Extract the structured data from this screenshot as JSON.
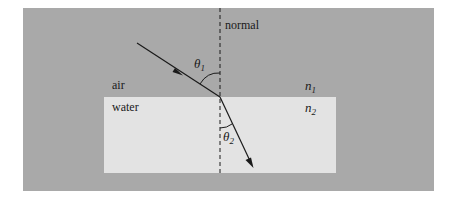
{
  "diagram": {
    "colors": {
      "background": "#ffffff",
      "air": "#a9a9a9",
      "water": "#e3e3e3",
      "line": "#1a1a1a"
    },
    "labels": {
      "normal": "normal",
      "air": "air",
      "water": "water",
      "n1_base": "n",
      "n1_sub": "1",
      "n2_base": "n",
      "n2_sub": "2",
      "theta1_base": "θ",
      "theta1_sub": "1",
      "theta2_base": "θ",
      "theta2_sub": "2"
    }
  }
}
